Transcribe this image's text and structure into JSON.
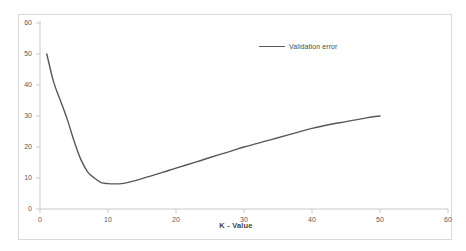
{
  "chart_data": {
    "type": "line",
    "title": "",
    "xlabel": "K - Value",
    "ylabel": "",
    "xlim": [
      0,
      60
    ],
    "ylim": [
      0,
      60
    ],
    "xticks": [
      "0",
      "10",
      "20",
      "30",
      "40",
      "50",
      "60"
    ],
    "yticks": [
      "0",
      "10",
      "20",
      "30",
      "40",
      "50",
      "60"
    ],
    "grid": false,
    "legend_position": "top-center",
    "series": [
      {
        "name": "Validation error",
        "color": "#585858",
        "x": [
          1,
          2,
          3,
          4,
          5,
          6,
          7,
          8,
          9,
          10,
          11,
          12,
          13,
          15,
          18,
          20,
          23,
          25,
          28,
          30,
          33,
          35,
          38,
          40,
          43,
          45,
          48,
          50
        ],
        "values": [
          50,
          41,
          35,
          29,
          22,
          16,
          12,
          10,
          8.5,
          8.2,
          8.1,
          8.2,
          8.6,
          9.8,
          11.8,
          13.2,
          15.2,
          16.6,
          18.6,
          20,
          21.8,
          23,
          24.8,
          26,
          27.4,
          28.2,
          29.4,
          30
        ]
      }
    ]
  },
  "legend": {
    "entries": [
      {
        "label": "Validation error",
        "color": "#585858",
        "marker": "line-swatch"
      }
    ]
  },
  "axes": {
    "x_title": "K - Value",
    "x_tick_labels": [
      "0",
      "10",
      "20",
      "30",
      "40",
      "50",
      "60"
    ],
    "y_tick_labels": [
      "0",
      "10",
      "20",
      "30",
      "40",
      "50",
      "60"
    ]
  },
  "colors": {
    "line": "#585858",
    "axis": "#c8c8c8",
    "frame": "#d9d9d9",
    "tick_text": "#5a5a5a",
    "background": "#ffffff"
  }
}
